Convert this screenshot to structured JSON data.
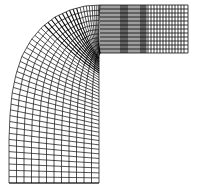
{
  "figure": {
    "description": "Structured curvilinear computational mesh of an L-shaped (90-degree bend) duct, with a straight horizontal channel at top-right joined by a curved bend to a widening vertical channel at bottom-left; grid lines cluster densely near the bend and at certain stations in the straight section.",
    "colors": {
      "background": "#ffffff",
      "grid_line": "#000000"
    },
    "mesh": {
      "straight_section": {
        "x_start": 100,
        "x_end": 188,
        "y_top": 5,
        "y_bottom": 53,
        "streamwise_stations": [
          100,
          102,
          104,
          106,
          108,
          110,
          112,
          114,
          116,
          118,
          120,
          121,
          122,
          123,
          124,
          125,
          126,
          127,
          128,
          130,
          132,
          134,
          136,
          138,
          140,
          141,
          142,
          143,
          144,
          145,
          146,
          148,
          151,
          154,
          157,
          160,
          163,
          166,
          169,
          172,
          175,
          178,
          181,
          184,
          188
        ],
        "cross_lines": 12
      },
      "bend_section": {
        "outer_curve": [
          [
            100,
            5
          ],
          [
            85,
            6
          ],
          [
            70,
            10
          ],
          [
            55,
            17
          ],
          [
            42,
            27
          ],
          [
            31,
            40
          ],
          [
            22,
            56
          ],
          [
            16,
            74
          ],
          [
            12,
            94
          ],
          [
            10,
            115
          ],
          [
            9,
            140
          ],
          [
            9,
            183
          ]
        ],
        "inner_curve": [
          [
            100,
            53
          ],
          [
            99,
            56
          ],
          [
            99,
            60
          ],
          [
            99,
            66
          ],
          [
            99,
            75
          ],
          [
            99,
            90
          ],
          [
            99,
            110
          ],
          [
            99,
            140
          ],
          [
            99,
            183
          ]
        ],
        "radial_lines": 48,
        "cross_lines": 12
      },
      "bottom_edge_y": 183
    }
  }
}
